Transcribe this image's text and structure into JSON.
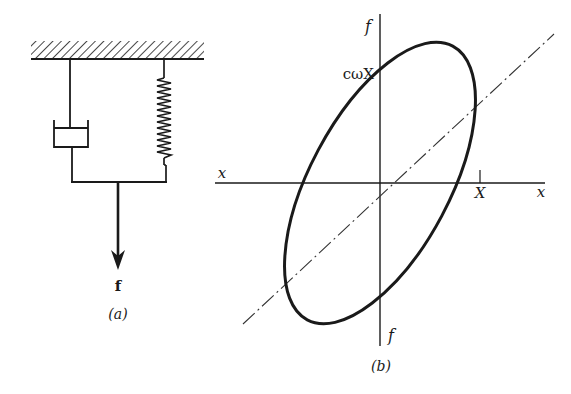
{
  "figure_a": {
    "caption": "(a)",
    "force_label": "f",
    "components": [
      "fixed-support",
      "dashpot",
      "spring",
      "connecting-bar",
      "force-arrow"
    ]
  },
  "figure_b": {
    "caption": "(b)",
    "axis_labels": {
      "x_left": "x",
      "x_right": "x",
      "f_top": "f",
      "f_bottom": "f"
    },
    "intercept_label": "cωX",
    "amplitude_label": "X",
    "curve": "hysteresis-ellipse",
    "reference_line": "dash-dot diagonal"
  },
  "colors": {
    "ink": "#1a1a1a",
    "background": "#ffffff"
  }
}
